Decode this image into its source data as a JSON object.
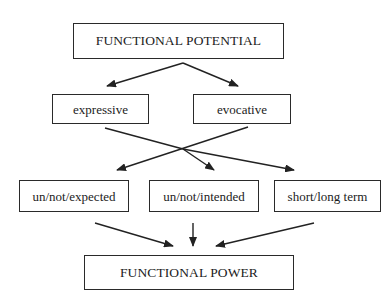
{
  "diagram": {
    "type": "flow",
    "nodes": {
      "functional_potential": "FUNCTIONAL POTENTIAL",
      "expressive": "expressive",
      "evocative": "evocative",
      "un_not_expected": "un/not/expected",
      "un_not_intended": "un/not/intended",
      "short_long_term": "short/long term",
      "functional_power": "FUNCTIONAL POWER"
    },
    "edges": [
      {
        "from": "FUNCTIONAL POTENTIAL",
        "to": "expressive"
      },
      {
        "from": "FUNCTIONAL POTENTIAL",
        "to": "evocative"
      },
      {
        "from": "expressive",
        "to": "un/not/intended"
      },
      {
        "from": "expressive",
        "to": "short/long term"
      },
      {
        "from": "evocative",
        "to": "un/not/expected"
      },
      {
        "from": "un/not/expected",
        "to": "FUNCTIONAL POWER"
      },
      {
        "from": "un/not/intended",
        "to": "FUNCTIONAL POWER"
      },
      {
        "from": "short/long term",
        "to": "FUNCTIONAL POWER"
      }
    ],
    "colors": {
      "line": "#222222",
      "text": "#1c1c1c",
      "background": "#ffffff"
    }
  }
}
